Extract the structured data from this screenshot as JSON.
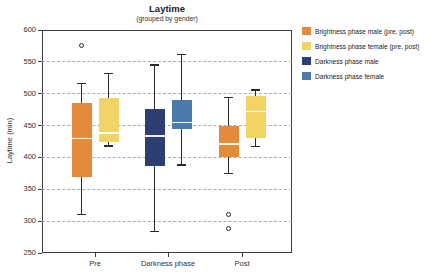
{
  "chart_data": {
    "type": "boxplot",
    "title": "Laytime",
    "subtitle": "(grouped by gender)",
    "ylabel": "Laytime (min)",
    "xlabel": "",
    "ylim": [
      250,
      600
    ],
    "yticks": [
      600,
      550,
      500,
      450,
      400,
      350,
      300,
      250
    ],
    "grid": "horizontal-dashed",
    "legend_position": "right",
    "categories": [
      "Pre",
      "Darkness phase",
      "Post"
    ],
    "legend": [
      {
        "label": "Brightness phase male (pre, post)",
        "color": "#E5893A"
      },
      {
        "label": "Brightness phase female (pre, post)",
        "color": "#F1D465"
      },
      {
        "label": "Darkness phase male",
        "color": "#2F3E72"
      },
      {
        "label": "Darkness phase female",
        "color": "#4B7AAB"
      }
    ],
    "boxes": [
      {
        "category": "Pre",
        "series": "Brightness phase male (pre, post)",
        "color": "#E5893A",
        "whisker_low": 310,
        "q1": 369,
        "median": 430,
        "q3": 485,
        "whisker_high": 516,
        "outliers": [
          575
        ]
      },
      {
        "category": "Pre",
        "series": "Brightness phase female (pre, post)",
        "color": "#F1D465",
        "whisker_low": 418,
        "q1": 424,
        "median": 438,
        "q3": 493,
        "whisker_high": 532,
        "outliers": []
      },
      {
        "category": "Darkness phase",
        "series": "Darkness phase male",
        "color": "#2F3E72",
        "whisker_low": 284,
        "q1": 387,
        "median": 434,
        "q3": 476,
        "whisker_high": 545,
        "outliers": []
      },
      {
        "category": "Darkness phase",
        "series": "Darkness phase female",
        "color": "#4B7AAB",
        "whisker_low": 388,
        "q1": 444,
        "median": 455,
        "q3": 490,
        "whisker_high": 562,
        "outliers": []
      },
      {
        "category": "Post",
        "series": "Brightness phase male (pre, post)",
        "color": "#E5893A",
        "whisker_low": 375,
        "q1": 401,
        "median": 421,
        "q3": 450,
        "whisker_high": 494,
        "outliers": [
          310,
          289
        ]
      },
      {
        "category": "Post",
        "series": "Brightness phase female (pre, post)",
        "color": "#F1D465",
        "whisker_low": 417,
        "q1": 430,
        "median": 472,
        "q3": 497,
        "whisker_high": 506,
        "outliers": []
      }
    ]
  }
}
